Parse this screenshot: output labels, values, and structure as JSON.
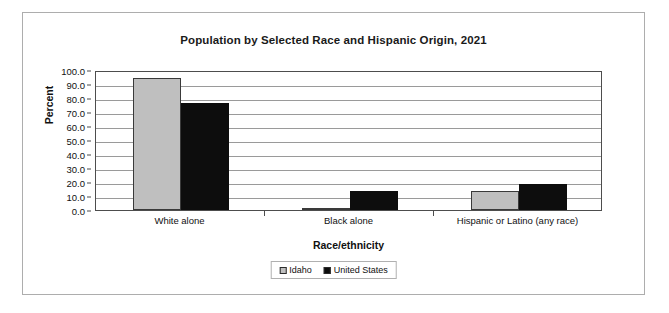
{
  "chart_data": {
    "type": "bar",
    "title": "Population by Selected Race and Hispanic Origin, 2021",
    "xlabel": "Race/ethnicity",
    "ylabel": "Percent",
    "categories": [
      "White alone",
      "Black alone",
      "Hispanic or Latino (any race)"
    ],
    "series": [
      {
        "name": "Idaho",
        "color": "#bfbfbf",
        "values": [
          94.0,
          1.0,
          13.3
        ]
      },
      {
        "name": "United States",
        "color": "#0d0d0d",
        "values": [
          76.3,
          13.6,
          18.9
        ]
      }
    ],
    "ylim": [
      0.0,
      100.0
    ],
    "ytick_step": 10.0,
    "ytick_labels": [
      "100.0",
      "90.0",
      "80.0",
      "70.0",
      "60.0",
      "50.0",
      "40.0",
      "30.0",
      "20.0",
      "10.0",
      "0.0"
    ],
    "grid": true,
    "legend_position": "bottom"
  }
}
